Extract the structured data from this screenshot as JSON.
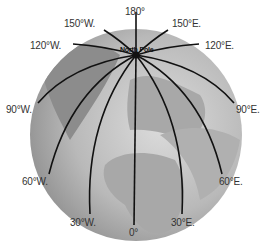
{
  "map": {
    "title": "North Pole",
    "center_label": "North Pole",
    "meridians": [
      {
        "label": "180°",
        "lon": 180
      },
      {
        "label": "150°W.",
        "lon": -150
      },
      {
        "label": "150°E.",
        "lon": 150
      },
      {
        "label": "120°W.",
        "lon": -120
      },
      {
        "label": "120°E.",
        "lon": 120
      },
      {
        "label": "90°W.",
        "lon": -90
      },
      {
        "label": "90°E.",
        "lon": 90
      },
      {
        "label": "60°W.",
        "lon": -60
      },
      {
        "label": "60°E.",
        "lon": 60
      },
      {
        "label": "30°W.",
        "lon": -30
      },
      {
        "label": "30°E.",
        "lon": 30
      },
      {
        "label": "0°",
        "lon": 0
      }
    ]
  }
}
